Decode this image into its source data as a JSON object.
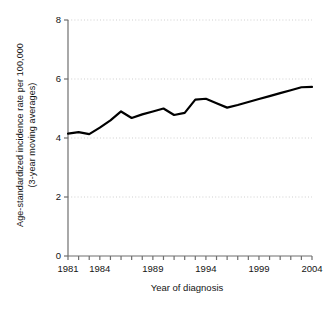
{
  "chart_data": {
    "type": "line",
    "title": "",
    "xlabel": "Year of diagnosis",
    "ylabel": "Age-standardized incidence rate per 100,000 (3-year moving averages)",
    "ylabel_line1": "Age-standardized incidence rate per 100,000",
    "ylabel_line2": "(3-year moving averages)",
    "xlim": [
      1981,
      2004
    ],
    "ylim": [
      0,
      8
    ],
    "ytick_values": [
      0,
      2,
      4,
      6,
      8
    ],
    "ytick_labels": [
      "0",
      "2",
      "4",
      "6",
      "8"
    ],
    "xtick_values": [
      1981,
      1982,
      1983,
      1984,
      1985,
      1986,
      1987,
      1988,
      1989,
      1990,
      1991,
      1992,
      1993,
      1994,
      1995,
      1996,
      1997,
      1998,
      1999,
      2000,
      2001,
      2002,
      2003,
      2004
    ],
    "xtick_labels_shown": [
      "1981",
      "1984",
      "1989",
      "1994",
      "1999",
      "2004"
    ],
    "xtick_labels_shown_values": [
      1981,
      1984,
      1989,
      1994,
      1999,
      2004
    ],
    "grid": "horizontal-dotted",
    "legend": "none",
    "line_color": "#000000",
    "line_width_px": 2.2,
    "x": [
      1981,
      1982,
      1983,
      1984,
      1985,
      1986,
      1987,
      1988,
      1989,
      1990,
      1991,
      1992,
      1993,
      1994,
      1995,
      1996,
      1997,
      1998,
      1999,
      2000,
      2001,
      2002,
      2003,
      2004
    ],
    "values": [
      4.15,
      4.2,
      4.13,
      4.35,
      4.6,
      4.9,
      4.68,
      4.8,
      4.9,
      5.0,
      4.78,
      4.85,
      5.3,
      5.33,
      5.18,
      5.03,
      5.12,
      5.22,
      5.32,
      5.42,
      5.52,
      5.62,
      5.72,
      5.73
    ]
  }
}
